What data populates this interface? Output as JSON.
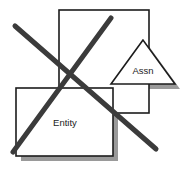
{
  "diagram": {
    "canvas": {
      "width": 188,
      "height": 171,
      "background": "#ffffff"
    },
    "colors": {
      "stroke": "#1c1c1c",
      "fill": "#ffffff",
      "shadow": "#9a9a9a",
      "cross": "#3b3b3b"
    },
    "shapes": [
      {
        "id": "outer-rectangle",
        "kind": "rectangle",
        "label": "",
        "x": 59,
        "y": 10,
        "width": 90,
        "height": 103,
        "stroke": "#1c1c1c",
        "fill": "#ffffff",
        "shadow": false
      },
      {
        "id": "entity-rectangle",
        "kind": "rectangle",
        "label": "Entity",
        "x": 16,
        "y": 88,
        "width": 97,
        "height": 68,
        "label_x": 65,
        "label_y": 123,
        "stroke": "#1c1c1c",
        "fill": "#ffffff",
        "shadow": true,
        "shadow_offset": 5
      },
      {
        "id": "assn-triangle",
        "kind": "triangle",
        "label": "Assn",
        "apex_x": 143,
        "apex_y": 40,
        "left_x": 111,
        "left_y": 84,
        "right_x": 175,
        "right_y": 84,
        "label_x": 143,
        "label_y": 71,
        "stroke": "#1c1c1c",
        "fill": "#ffffff",
        "shadow": true,
        "shadow_offset": 5
      }
    ],
    "cross_out": {
      "id": "cross-out-mark",
      "color": "#3b3b3b",
      "stroke_width": 5,
      "strokes": [
        {
          "id": "stroke-descending",
          "x1": 15,
          "y1": 26,
          "x2": 156,
          "y2": 149
        },
        {
          "id": "stroke-ascending",
          "x1": 13,
          "y1": 152,
          "x2": 111,
          "y2": 18
        }
      ]
    }
  }
}
